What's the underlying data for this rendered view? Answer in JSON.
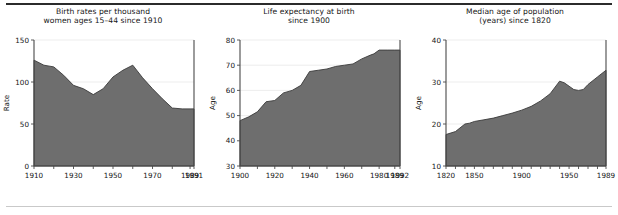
{
  "figure": {
    "top_rule_color": "#2b2b2b",
    "bottom_rule_color": "#c9c9c9",
    "fill_color": "#6e6e6e",
    "line_color": "#3a3a3a",
    "grid_color": "#e8e8e8"
  },
  "chart_data": [
    {
      "type": "area",
      "title": "Birth rates per thousand\nwomen ages 15–44 since 1910",
      "xlabel": "",
      "ylabel": "Rate",
      "xlim": [
        1910,
        1991
      ],
      "ylim": [
        0,
        150
      ],
      "grid": true,
      "legend": "none",
      "yticks": [
        0,
        50,
        100,
        150
      ],
      "xticks": [
        1910,
        1920,
        1930,
        1940,
        1950,
        1960,
        1970,
        1980,
        1989,
        1991
      ],
      "xtick_labels": [
        "1910",
        "1930",
        "1950",
        "1970",
        "1989",
        "1991"
      ],
      "xtick_labels_at": [
        1910,
        1930,
        1950,
        1970,
        1989,
        1991
      ],
      "x": [
        1910,
        1915,
        1920,
        1925,
        1930,
        1935,
        1940,
        1945,
        1950,
        1955,
        1960,
        1965,
        1970,
        1975,
        1980,
        1985,
        1989,
        1991
      ],
      "values": [
        126,
        120,
        118,
        108,
        96,
        92,
        85,
        92,
        106,
        114,
        120,
        105,
        92,
        80,
        69,
        68,
        68,
        68
      ]
    },
    {
      "type": "area",
      "title": "Life expectancy at birth\nsince 1900",
      "xlabel": "",
      "ylabel": "Age",
      "xlim": [
        1900,
        1992
      ],
      "ylim": [
        30,
        80
      ],
      "grid": true,
      "legend": "none",
      "yticks": [
        30,
        40,
        50,
        60,
        70,
        80
      ],
      "xticks": [
        1900,
        1910,
        1920,
        1930,
        1940,
        1950,
        1960,
        1970,
        1980,
        1989,
        1992
      ],
      "xtick_labels": [
        "1900",
        "1920",
        "1940",
        "1960",
        "1980",
        "1989",
        "1992"
      ],
      "xtick_labels_at": [
        1900,
        1920,
        1940,
        1960,
        1980,
        1989,
        1992
      ],
      "x": [
        1900,
        1905,
        1910,
        1915,
        1920,
        1925,
        1930,
        1935,
        1940,
        1945,
        1950,
        1955,
        1960,
        1965,
        1970,
        1975,
        1977,
        1980,
        1985,
        1989,
        1992
      ],
      "values": [
        48.0,
        49.5,
        51.5,
        55.5,
        56.0,
        59.0,
        60.0,
        62.0,
        67.5,
        68.0,
        68.5,
        69.5,
        70.0,
        70.5,
        72.5,
        74.0,
        74.5,
        76.0,
        76.0,
        76.0,
        76.0
      ]
    },
    {
      "type": "area",
      "title": "Median age of population\n(years) since 1820",
      "xlabel": "",
      "ylabel": "Age",
      "xlim": [
        1820,
        1989
      ],
      "ylim": [
        10,
        40
      ],
      "grid": true,
      "legend": "none",
      "yticks": [
        10,
        20,
        30,
        40
      ],
      "xticks": [
        1820,
        1830,
        1840,
        1850,
        1860,
        1870,
        1880,
        1890,
        1900,
        1910,
        1920,
        1930,
        1940,
        1950,
        1960,
        1970,
        1980,
        1989
      ],
      "xtick_labels": [
        "1820",
        "1850",
        "1900",
        "1950",
        "1989"
      ],
      "xtick_labels_at": [
        1820,
        1850,
        1900,
        1950,
        1989
      ],
      "x": [
        1820,
        1830,
        1840,
        1845,
        1850,
        1860,
        1870,
        1880,
        1890,
        1900,
        1910,
        1920,
        1930,
        1940,
        1945,
        1950,
        1955,
        1960,
        1965,
        1970,
        1980,
        1989
      ],
      "values": [
        17.5,
        18.2,
        20.0,
        20.2,
        20.6,
        21.0,
        21.4,
        22.0,
        22.6,
        23.3,
        24.2,
        25.5,
        27.2,
        30.2,
        29.8,
        29.0,
        28.2,
        28.0,
        28.2,
        29.4,
        31.2,
        32.8
      ]
    }
  ]
}
